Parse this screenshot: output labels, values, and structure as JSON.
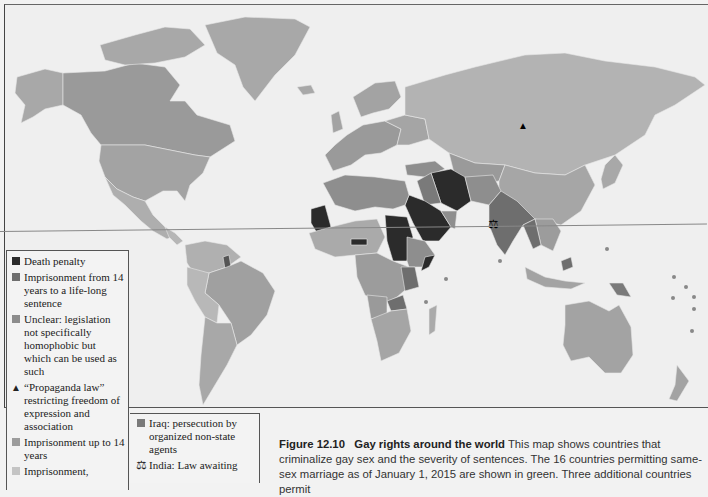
{
  "map": {
    "colors": {
      "background": "#efefef",
      "death_penalty": "#2b2b2b",
      "life_sentence": "#6e6e6e",
      "unclear": "#8c8c8c",
      "up_to_14": "#9c9c9c",
      "imprisonment_light": "#c4c4c4",
      "iraq_persecution": "#7a7a7a",
      "same_sex_marriage": "#a3a3a3",
      "other": "#b0b0b0",
      "russia": "#b3b3b3"
    },
    "markers": [
      {
        "type": "propaganda-law",
        "glyph": "▲",
        "location": "Russia"
      },
      {
        "type": "law-awaiting",
        "glyph": "⚖",
        "location": "India"
      }
    ]
  },
  "legend": {
    "items": [
      {
        "label": "Death penalty",
        "swatch": "#2b2b2b"
      },
      {
        "label": "Imprisonment from 14 years to a life-long sentence",
        "swatch": "#6e6e6e"
      },
      {
        "label": "Unclear: legislation not specifically homophobic but which can be used as such",
        "swatch": "#8c8c8c"
      },
      {
        "label": "“Propaganda law” restricting freedom of expression and association",
        "glyph": "▲"
      },
      {
        "label": "Imprisonment up to 14 years",
        "swatch": "#9c9c9c"
      },
      {
        "label": "Imprisonment,",
        "swatch": "#c4c4c4"
      }
    ],
    "secondary_items": [
      {
        "label": "Iraq: persecution by organized non-state agents",
        "swatch": "#7a7a7a"
      },
      {
        "label": "India: Law awaiting",
        "glyph": "⚖"
      }
    ]
  },
  "caption": {
    "figure_label": "Figure 12.10",
    "title": "Gay rights around the world",
    "text": "This map shows countries that criminalize gay sex and the severity of sentences. The 16 countries permitting same-sex marriage as of January 1, 2015 are shown in green. Three additional countries permit"
  }
}
